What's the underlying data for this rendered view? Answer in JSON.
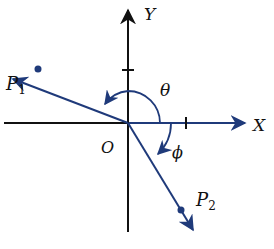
{
  "diagram": {
    "type": "coordinate-vectors",
    "axes": {
      "x_label": "X",
      "y_label": "Y",
      "origin_label": "O"
    },
    "points": [
      {
        "name": "P",
        "subscript": "1",
        "quadrant": "II"
      },
      {
        "name": "P",
        "subscript": "2",
        "quadrant": "IV"
      }
    ],
    "angles": {
      "theta_label": "θ",
      "phi_label": "ϕ"
    },
    "colors": {
      "axis": "#111111",
      "vector": "#1f3a7a",
      "text": "#111111",
      "background": "#ffffff"
    }
  }
}
